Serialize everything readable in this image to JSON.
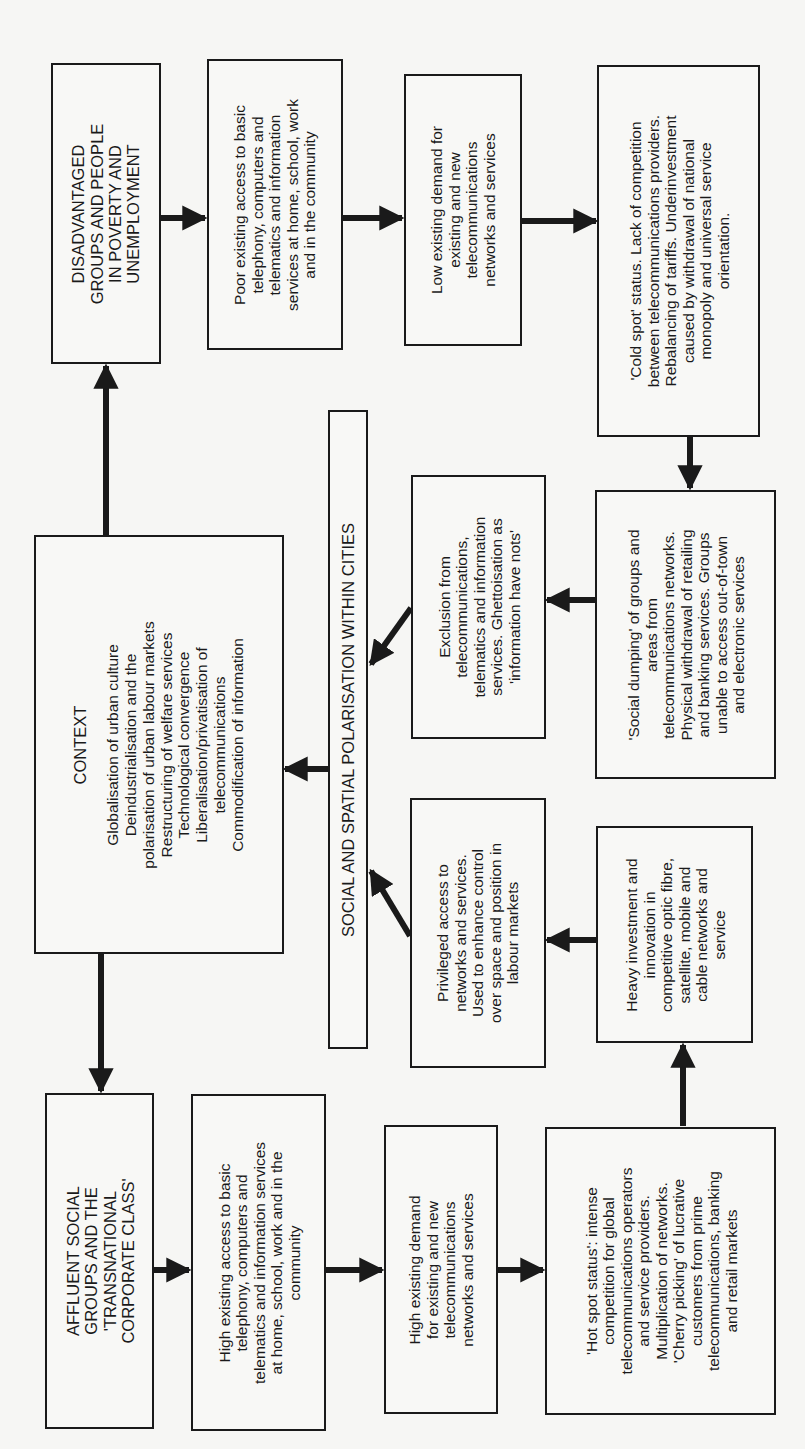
{
  "diagram": {
    "orientation": "rotated-90-ccw",
    "nodes": {
      "disadvantaged": {
        "lines": [
          "DISADVANTAGED",
          "GROUPS AND PEOPLE",
          "IN POVERTY AND",
          "UNEMPLOYMENT"
        ]
      },
      "poor_access": {
        "lines": [
          "Poor existing access to basic",
          "telephony, computers and",
          "telematics and information",
          "services at home, school, work",
          "and in the community"
        ]
      },
      "low_demand": {
        "lines": [
          "Low existing demand for",
          "existing and new",
          "telecommunications",
          "networks and services"
        ]
      },
      "cold_spot": {
        "lines": [
          "'Cold spot' status. Lack of competition",
          "between telecommunications providers.",
          "Rebalancing of tariffs. Underinvestment",
          "caused by withdrawal of national",
          "monopoly and universal service",
          "orientation."
        ]
      },
      "social_dumping": {
        "lines": [
          "'Social dumping' of groups and",
          "areas from",
          "telecommunications networks.",
          "Physical withdrawal of retailing",
          "and banking services. Groups",
          "unable to access out-of-town",
          "and electronic services"
        ]
      },
      "exclusion": {
        "lines": [
          "Exclusion from",
          "telecommunications,",
          "telematics and information",
          "services. Ghettoisation as",
          "'information have nots'"
        ]
      },
      "polarisation": {
        "label": "SOCIAL AND SPATIAL POLARISATION WITHIN CITIES"
      },
      "context": {
        "title": "CONTEXT",
        "items": [
          "Globalisation of urban culture",
          "Deindustrialisation and the",
          "polarisation of urban labour markets",
          "Restructuring of welfare services",
          "Technological convergence",
          "Liberalisation/privatisation of",
          "telecommunications",
          "Commodification of information"
        ]
      },
      "privileged": {
        "lines": [
          "Privileged access to",
          "networks and services.",
          "Used to enhance control",
          "over space and position in",
          "labour markets"
        ]
      },
      "heavy_investment": {
        "lines": [
          "Heavy investment and",
          "innovation in",
          "competitive optic fibre,",
          "satellite, mobile and",
          "cable networks and",
          "service"
        ]
      },
      "affluent": {
        "lines": [
          "AFFLUENT SOCIAL",
          "GROUPS AND THE",
          "'TRANSNATIONAL",
          "CORPORATE CLASS'"
        ]
      },
      "high_access": {
        "lines": [
          "High existing access to basic",
          "telephony, computers and",
          "telematics and information services",
          "at home, school, work and in the",
          "community"
        ]
      },
      "high_demand": {
        "lines": [
          "High existing demand",
          "for existing and new",
          "telecommunications",
          "networks and services"
        ]
      },
      "hot_spot": {
        "lines": [
          "'Hot spot status': intense",
          "competition for global",
          "telecommunications operators",
          "and service providers.",
          "Multiplication of networks.",
          "'Cherry picking' of lucrative",
          "customers from prime",
          "telecommunications, banking",
          "and retail markets"
        ]
      }
    },
    "edges": [
      [
        "context",
        "disadvantaged"
      ],
      [
        "context",
        "affluent"
      ],
      [
        "disadvantaged",
        "poor_access"
      ],
      [
        "poor_access",
        "low_demand"
      ],
      [
        "low_demand",
        "cold_spot"
      ],
      [
        "cold_spot",
        "social_dumping"
      ],
      [
        "social_dumping",
        "exclusion"
      ],
      [
        "exclusion",
        "polarisation"
      ],
      [
        "polarisation",
        "context"
      ],
      [
        "affluent",
        "high_access"
      ],
      [
        "high_access",
        "high_demand"
      ],
      [
        "high_demand",
        "hot_spot"
      ],
      [
        "hot_spot",
        "heavy_investment"
      ],
      [
        "heavy_investment",
        "privileged"
      ],
      [
        "privileged",
        "polarisation"
      ]
    ],
    "colors": {
      "ink": "#1a1a1a",
      "paper": "#f6f6f4"
    }
  }
}
